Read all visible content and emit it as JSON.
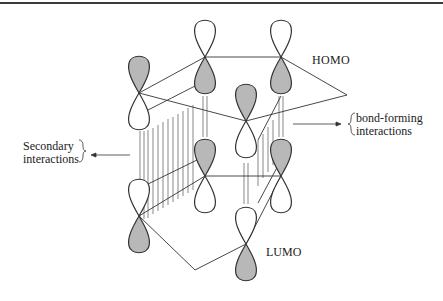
{
  "diagram": {
    "type": "frontier-orbital-interaction",
    "labels": {
      "homo": "HOMO",
      "lumo": "LUMO",
      "bond_forming_line1": "bond-forming",
      "bond_forming_line2": "interactions",
      "secondary_line1": "Secondary",
      "secondary_line2": "interactions"
    },
    "colors": {
      "shaded_lobe": "#b8b8b8",
      "outline": "#333333",
      "background": "#ffffff"
    }
  }
}
